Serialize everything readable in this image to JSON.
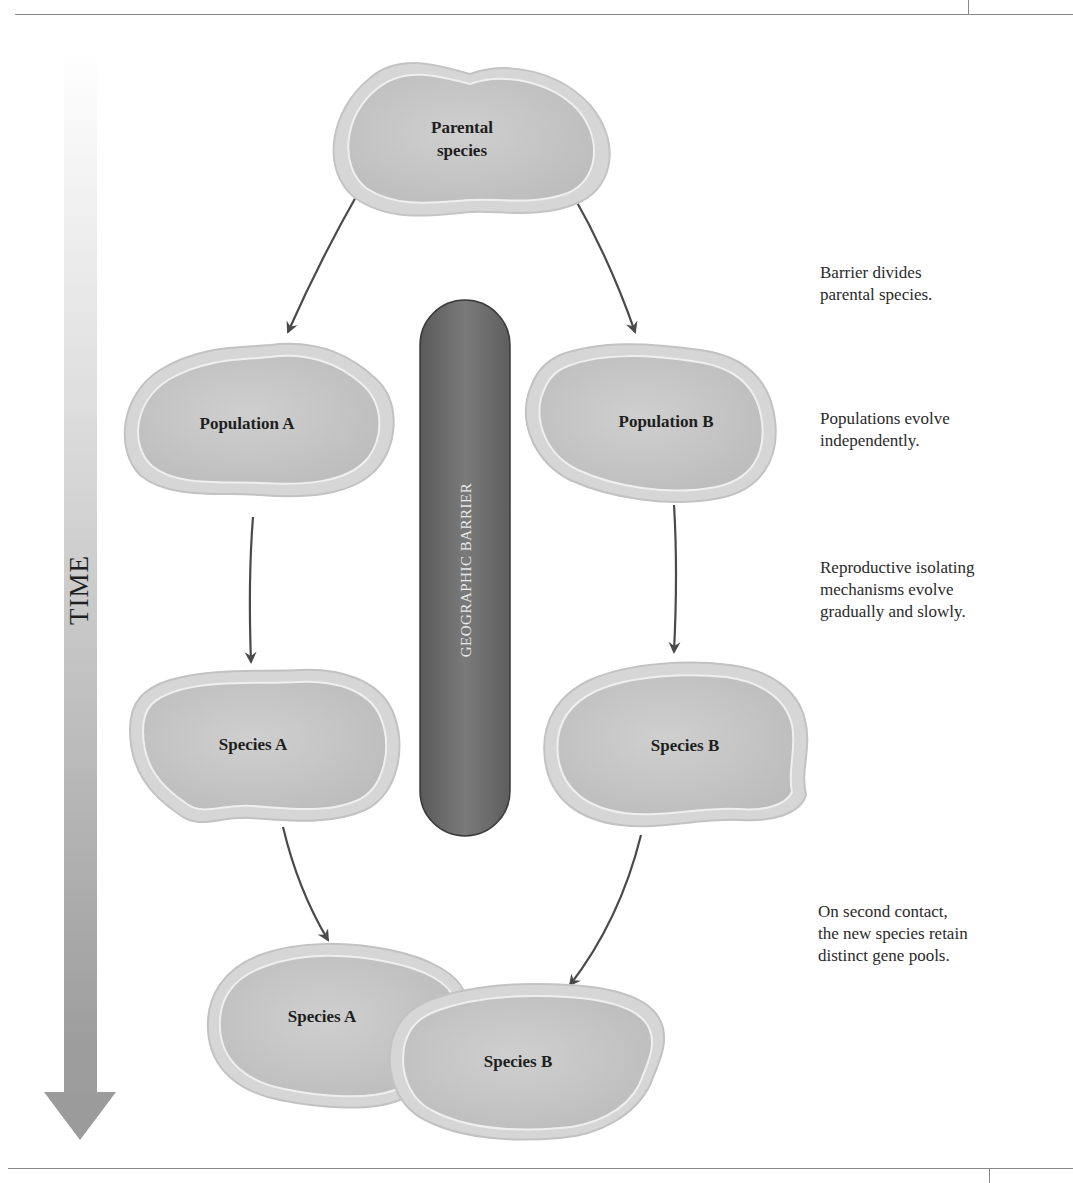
{
  "figure": {
    "time_axis": {
      "label": "TIME",
      "direction": "down"
    },
    "barrier": {
      "label": "GEOGRAPHIC BARRIER"
    },
    "nodes": {
      "parental": {
        "label": "Parental species"
      },
      "population_a": {
        "label": "Population A"
      },
      "population_b": {
        "label": "Population B"
      },
      "species_a": {
        "label": "Species A"
      },
      "species_b": {
        "label": "Species B"
      },
      "final_species_a": {
        "label": "Species A"
      },
      "final_species_b": {
        "label": "Species B"
      }
    },
    "parental_line1": "Parental",
    "parental_line2": "species",
    "notes": [
      {
        "line1": "Barrier divides",
        "line2": "parental species."
      },
      {
        "line1": "Populations evolve",
        "line2": "independently."
      },
      {
        "line1": "Reproductive isolating",
        "line2": "mechanisms evolve",
        "line3": "gradually and slowly."
      },
      {
        "line1": "On second contact,",
        "line2": "the new species retain",
        "line3": "distinct gene pools."
      }
    ],
    "colors": {
      "blob_fill": "#c6c6c6",
      "blob_rim": "#dcdcdc",
      "barrier_fill": "#6e6e6e",
      "arrow": "#4a4a4a",
      "time_arrow": "#a9a9a9"
    }
  }
}
